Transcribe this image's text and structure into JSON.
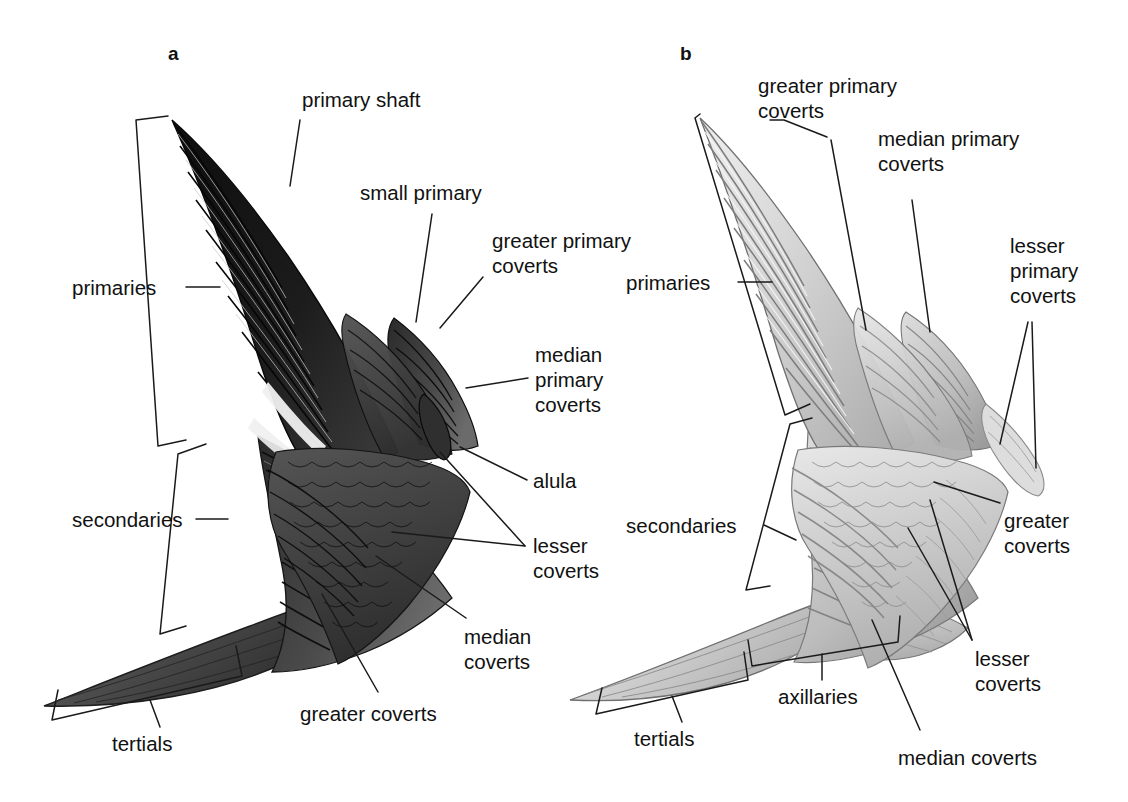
{
  "figure": {
    "background": "#ffffff",
    "ink": "#111111",
    "panels": [
      {
        "id": "a",
        "letter": "a",
        "view": "upperwing (dorsal), dark plumage"
      },
      {
        "id": "b",
        "letter": "b",
        "view": "underwing (ventral), pale plumage"
      }
    ]
  },
  "panel_a": {
    "letter": "a",
    "labels": {
      "primary_shaft": "primary shaft",
      "small_primary": "small primary",
      "greater_primary_coverts": "greater primary\ncoverts",
      "median_primary_coverts": "median\nprimary\ncoverts",
      "alula": "alula",
      "lesser_coverts": "lesser\ncoverts",
      "median_coverts": "median\ncoverts",
      "greater_coverts": "greater coverts",
      "primaries": "primaries",
      "secondaries": "secondaries",
      "tertials": "tertials"
    }
  },
  "panel_b": {
    "letter": "b",
    "labels": {
      "greater_primary_coverts": "greater primary\ncoverts",
      "median_primary_coverts": "median primary\ncoverts",
      "lesser_primary_coverts": "lesser\nprimary\ncoverts",
      "primaries": "primaries",
      "secondaries": "secondaries",
      "greater_coverts": "greater\ncoverts",
      "lesser_coverts": "lesser\ncoverts",
      "median_coverts": "median coverts",
      "axillaries": "axillaries",
      "tertials": "tertials"
    }
  },
  "colors": {
    "leader_line": "#1a1a1a",
    "bracket": "#1a1a1a",
    "wing_a_dark": "#141414",
    "wing_a_mid": "#3a3a3a",
    "wing_a_light": "#6e6e6e",
    "wing_b_dark": "#8d8d8d",
    "wing_b_mid": "#b4b4b4",
    "wing_b_light": "#dcdcdc"
  }
}
